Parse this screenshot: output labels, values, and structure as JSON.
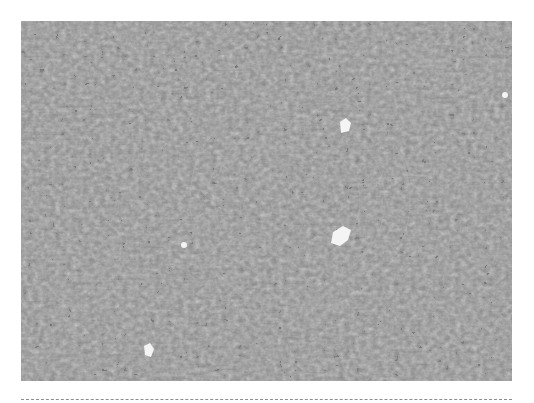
{
  "figure": {
    "type": "grayscale histology micrograph",
    "colors": {
      "background": "#ffffff",
      "tissue_base": "#8a8a8a",
      "nuclei": "#1e1e1e",
      "lumen": "#f4f4f4",
      "divider": "#8c8c8c"
    },
    "lumina": [
      {
        "cx": 345,
        "cy": 128,
        "r": 7
      },
      {
        "cx": 340,
        "cy": 240,
        "r": 12
      },
      {
        "cx": 148,
        "cy": 352,
        "r": 7
      },
      {
        "cx": 184,
        "cy": 245,
        "r": 4
      }
    ],
    "whorls": [
      {
        "cx": 300,
        "cy": 200,
        "r": 110
      },
      {
        "cx": 470,
        "cy": 55,
        "r": 40
      },
      {
        "cx": 170,
        "cy": 60,
        "r": 45
      },
      {
        "cx": 80,
        "cy": 270,
        "r": 45
      }
    ]
  }
}
